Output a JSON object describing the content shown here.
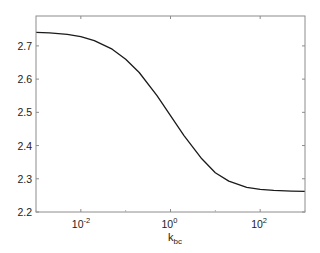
{
  "chart_data": {
    "type": "line",
    "title": "",
    "xlabel": "k",
    "xlabel_subscript": "bc",
    "ylabel": "",
    "xscale": "log",
    "xlim": [
      0.001,
      1000
    ],
    "ylim": [
      2.2,
      2.79
    ],
    "grid": false,
    "legend": null,
    "x_ticks": [
      {
        "value": 0.01,
        "base": "10",
        "exp": "-2"
      },
      {
        "value": 1,
        "base": "10",
        "exp": "0"
      },
      {
        "value": 100,
        "base": "10",
        "exp": "2"
      }
    ],
    "y_ticks": [
      "2.2",
      "2.3",
      "2.4",
      "2.5",
      "2.6",
      "2.7"
    ],
    "series": [
      {
        "name": "curve",
        "color": "#1a1a1a",
        "x": [
          0.001,
          0.002,
          0.005,
          0.01,
          0.02,
          0.05,
          0.1,
          0.2,
          0.5,
          1,
          2,
          5,
          10,
          20,
          50,
          100,
          200,
          500,
          1000
        ],
        "y": [
          2.741,
          2.739,
          2.735,
          2.728,
          2.716,
          2.69,
          2.66,
          2.62,
          2.55,
          2.49,
          2.43,
          2.36,
          2.318,
          2.293,
          2.274,
          2.268,
          2.265,
          2.263,
          2.262
        ]
      }
    ]
  }
}
